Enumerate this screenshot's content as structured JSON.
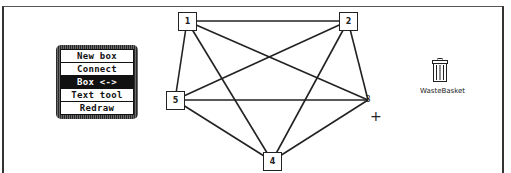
{
  "palette": {
    "items": [
      {
        "label": "New box",
        "selected": false
      },
      {
        "label": "Connect",
        "selected": false
      },
      {
        "label": "Box <-> Label",
        "selected": true
      },
      {
        "label": "Text tool",
        "selected": false
      },
      {
        "label": "Redraw",
        "selected": false
      }
    ]
  },
  "graph": {
    "nodes": [
      {
        "id": "1",
        "label": "1",
        "boxed": true,
        "x": 187,
        "y": 21
      },
      {
        "id": "2",
        "label": "2",
        "boxed": true,
        "x": 348,
        "y": 21
      },
      {
        "id": "3",
        "label": "3",
        "boxed": false,
        "x": 368,
        "y": 100
      },
      {
        "id": "4",
        "label": "4",
        "boxed": true,
        "x": 272,
        "y": 161
      },
      {
        "id": "5",
        "label": "5",
        "boxed": true,
        "x": 175,
        "y": 100
      }
    ],
    "edges": [
      [
        "1",
        "2"
      ],
      [
        "1",
        "3"
      ],
      [
        "1",
        "4"
      ],
      [
        "1",
        "5"
      ],
      [
        "2",
        "3"
      ],
      [
        "2",
        "4"
      ],
      [
        "2",
        "5"
      ],
      [
        "3",
        "4"
      ],
      [
        "3",
        "5"
      ],
      [
        "4",
        "5"
      ]
    ]
  },
  "desktop": {
    "wastebasket_label": "WasteBasket"
  },
  "cursor": {
    "symbol": "+",
    "x": 374,
    "y": 116
  }
}
